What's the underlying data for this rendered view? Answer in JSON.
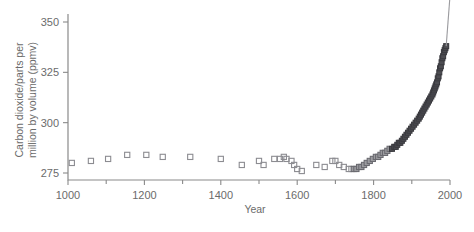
{
  "chart_data": {
    "type": "scatter",
    "title": "",
    "xlabel": "Year",
    "ylabel": "Carbon dioxide/parts per million by volume (ppmv)",
    "ylabel_line1": "Carbon dioxide/parts per",
    "ylabel_line2": "million by volume (ppmv)",
    "xlim": [
      1000,
      2000
    ],
    "ylim": [
      268,
      355
    ],
    "grid": false,
    "legend": false,
    "x_ticks_major": [
      1000,
      1200,
      1400,
      1600,
      1800,
      2000
    ],
    "x_ticks_minor": [
      1100,
      1300,
      1500,
      1700,
      1900
    ],
    "x_tick_labels": [
      "1000",
      "1200",
      "1400",
      "1600",
      "1800",
      "2000"
    ],
    "y_ticks_major": [
      275,
      300,
      325,
      350
    ],
    "y_tick_labels": [
      "275",
      "300",
      "325",
      "350"
    ],
    "marker": "square",
    "marker_colors": {
      "open": "#8c8c91",
      "mid": "#9b9b9f",
      "dark": "#4d4d52"
    },
    "axis_color": "#8a8a8a",
    "series": [
      {
        "name": "Ice core CO2 (open squares)",
        "style": "open",
        "points": [
          [
            1010,
            280
          ],
          [
            1060,
            281
          ],
          [
            1105,
            282
          ],
          [
            1155,
            284
          ],
          [
            1205,
            284
          ],
          [
            1248,
            283
          ],
          [
            1320,
            283
          ],
          [
            1400,
            282
          ],
          [
            1455,
            279
          ],
          [
            1500,
            281
          ],
          [
            1512,
            279
          ],
          [
            1540,
            282
          ],
          [
            1555,
            282
          ],
          [
            1565,
            283
          ],
          [
            1572,
            282
          ],
          [
            1585,
            281
          ],
          [
            1592,
            279
          ],
          [
            1600,
            277
          ],
          [
            1612,
            276
          ],
          [
            1650,
            279
          ],
          [
            1672,
            278
          ],
          [
            1692,
            281
          ],
          [
            1700,
            281
          ],
          [
            1710,
            279
          ],
          [
            1722,
            278
          ],
          [
            1735,
            277
          ],
          [
            1742,
            277
          ]
        ]
      },
      {
        "name": "Ice core CO2 (shaded squares)",
        "style": "mid",
        "points": [
          [
            1748,
            277
          ],
          [
            1755,
            277
          ],
          [
            1762,
            278
          ],
          [
            1768,
            278
          ],
          [
            1775,
            279
          ],
          [
            1782,
            280
          ],
          [
            1790,
            281
          ],
          [
            1798,
            282
          ],
          [
            1806,
            283
          ],
          [
            1812,
            283
          ],
          [
            1818,
            284
          ],
          [
            1824,
            285
          ],
          [
            1830,
            285
          ],
          [
            1836,
            286
          ],
          [
            1842,
            287
          ]
        ]
      },
      {
        "name": "Modern / Mauna Loa CO2 (dark squares)",
        "style": "dark",
        "points": [
          [
            1848,
            287
          ],
          [
            1854,
            288
          ],
          [
            1858,
            288
          ],
          [
            1862,
            289
          ],
          [
            1866,
            290
          ],
          [
            1870,
            290
          ],
          [
            1874,
            291
          ],
          [
            1878,
            292
          ],
          [
            1882,
            293
          ],
          [
            1886,
            294
          ],
          [
            1890,
            295
          ],
          [
            1894,
            296
          ],
          [
            1898,
            297
          ],
          [
            1902,
            298
          ],
          [
            1906,
            299
          ],
          [
            1910,
            300
          ],
          [
            1914,
            301
          ],
          [
            1918,
            302
          ],
          [
            1921,
            303
          ],
          [
            1924,
            304
          ],
          [
            1927,
            305
          ],
          [
            1930,
            306
          ],
          [
            1933,
            307
          ],
          [
            1936,
            308
          ],
          [
            1939,
            309
          ],
          [
            1942,
            310
          ],
          [
            1945,
            311
          ],
          [
            1948,
            312
          ],
          [
            1951,
            313
          ],
          [
            1954,
            314
          ],
          [
            1956,
            315
          ],
          [
            1958,
            316
          ],
          [
            1960,
            317
          ],
          [
            1962,
            318
          ],
          [
            1964,
            319
          ],
          [
            1966,
            320
          ],
          [
            1968,
            322
          ],
          [
            1970,
            323
          ],
          [
            1972,
            325
          ],
          [
            1974,
            327
          ],
          [
            1976,
            328
          ],
          [
            1978,
            330
          ],
          [
            1980,
            332
          ],
          [
            1982,
            333
          ],
          [
            1984,
            335
          ],
          [
            1986,
            336
          ],
          [
            1988,
            337
          ],
          [
            1990,
            338
          ]
        ]
      }
    ],
    "annotation_line": {
      "name": "projection-line",
      "from": [
        1990,
        338
      ],
      "to": [
        2002,
        368
      ],
      "description": "thin line rising past top of axes"
    }
  }
}
